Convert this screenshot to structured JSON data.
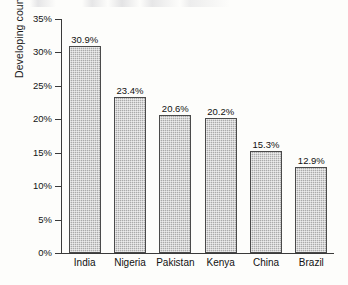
{
  "chart_data": {
    "type": "bar",
    "title": "",
    "subtitle": "",
    "xlabel": "",
    "ylabel": "Developing countries (tariff rate)",
    "categories": [
      "India",
      "Nigeria",
      "Pakistan",
      "Kenya",
      "China",
      "Brazil"
    ],
    "values": [
      30.9,
      23.4,
      20.6,
      20.2,
      15.3,
      12.9
    ],
    "value_labels": [
      "30.9%",
      "23.4%",
      "20.6%",
      "20.2%",
      "15.3%",
      "12.9%"
    ],
    "ylim": [
      0,
      35
    ],
    "ytick_values": [
      0,
      5,
      10,
      15,
      20,
      25,
      30,
      35
    ],
    "ytick_labels": [
      "0%",
      "5%",
      "10%",
      "15%",
      "20%",
      "25%",
      "30%",
      "35%"
    ],
    "grid": false,
    "legend": null,
    "legend_position": "none",
    "bar_fill_color": "#aaaaaa",
    "bar_edge_color": "#4a4a4a",
    "axis_color": "#3a3a3a",
    "text_color": "#111111",
    "background_color": "#fdfdfb"
  }
}
